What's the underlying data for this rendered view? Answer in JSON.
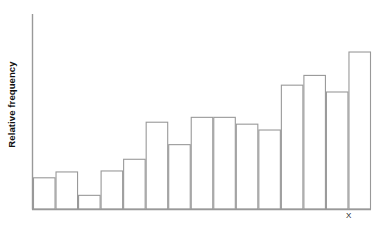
{
  "chart_data": {
    "type": "bar",
    "title": "",
    "subtitle": "",
    "xlabel": "X",
    "ylabel": "Relative frequency",
    "grid": false,
    "legend": null,
    "categories": [
      "1",
      "2",
      "3",
      "4",
      "5",
      "6",
      "7",
      "8",
      "9",
      "10",
      "11",
      "12",
      "13",
      "14",
      "15"
    ],
    "values": [
      0.16,
      0.19,
      0.07,
      0.195,
      0.255,
      0.445,
      0.33,
      0.47,
      0.47,
      0.435,
      0.405,
      0.635,
      0.685,
      0.6,
      0.805
    ],
    "ylim": [
      0,
      1
    ],
    "xlim": [
      0,
      15
    ],
    "axis": {
      "y_axis_visible": true,
      "x_axis_visible": true,
      "y_ticks": [],
      "x_ticks": []
    },
    "style": {
      "bar_fill": "#ffffff",
      "bar_stroke": "#999999",
      "axis_color": "#999999",
      "background": "#ffffff",
      "bar_count": 15
    }
  },
  "labels": {
    "y_axis": "Relative frequency",
    "x_axis": "X"
  }
}
